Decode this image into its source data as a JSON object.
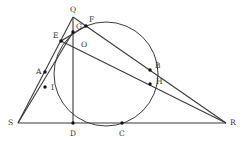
{
  "diagram": {
    "type": "geometry",
    "stroke_color": "#3a3a3a",
    "circle": {
      "cx": 106,
      "cy": 74,
      "r": 52
    },
    "points": {
      "Q": {
        "x": 73,
        "y": 17,
        "label": "Q",
        "lx": 70,
        "ly": 12
      },
      "F": {
        "x": 86,
        "y": 26,
        "label": "F",
        "lx": 89,
        "ly": 22
      },
      "G": {
        "x": 73,
        "y": 32,
        "label": "G",
        "lx": 76,
        "ly": 29
      },
      "E": {
        "x": 61,
        "y": 41,
        "label": "E",
        "lx": 53,
        "ly": 38
      },
      "O": {
        "x": 73,
        "y": 48,
        "label": "O",
        "lx": 81,
        "ly": 47
      },
      "A": {
        "x": 45,
        "y": 72,
        "label": "A",
        "lx": 36,
        "ly": 74
      },
      "I": {
        "x": 45,
        "y": 87,
        "label": "I",
        "lx": 51,
        "ly": 90
      },
      "S": {
        "x": 18,
        "y": 123,
        "label": "S",
        "lx": 8,
        "ly": 125
      },
      "D": {
        "x": 73,
        "y": 123,
        "label": "D",
        "lx": 70,
        "ly": 136
      },
      "C": {
        "x": 122,
        "y": 123,
        "label": "C",
        "lx": 119,
        "ly": 136
      },
      "R": {
        "x": 226,
        "y": 123,
        "label": "R",
        "lx": 230,
        "ly": 125
      },
      "B": {
        "x": 150,
        "y": 70,
        "label": "B",
        "lx": 155,
        "ly": 68
      },
      "H": {
        "x": 150,
        "y": 84,
        "label": "H",
        "lx": 156,
        "ly": 84
      }
    },
    "segments": [
      [
        "S",
        "Q"
      ],
      [
        "Q",
        "F"
      ],
      [
        "F",
        "R"
      ],
      [
        "S",
        "R"
      ],
      [
        "Q",
        "D"
      ],
      [
        "E",
        "R"
      ],
      [
        "S",
        "G"
      ],
      [
        "E",
        "F"
      ]
    ],
    "dots": [
      "G",
      "E",
      "F",
      "A",
      "I",
      "B",
      "H",
      "D",
      "C"
    ]
  }
}
